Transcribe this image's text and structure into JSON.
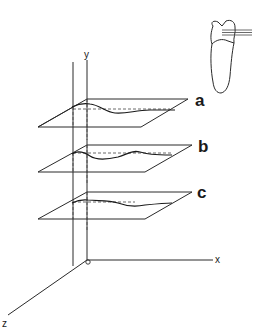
{
  "diagram": {
    "axes": {
      "x_label": "x",
      "y_label": "y",
      "z_label": "z",
      "origin_marker": "o"
    },
    "planes": [
      {
        "label": "a"
      },
      {
        "label": "b"
      },
      {
        "label": "c"
      }
    ],
    "inset": {
      "name": "tooth-sketch",
      "section_lines": 3
    },
    "colors": {
      "line": "#2a2a2a",
      "background": "#ffffff"
    }
  }
}
